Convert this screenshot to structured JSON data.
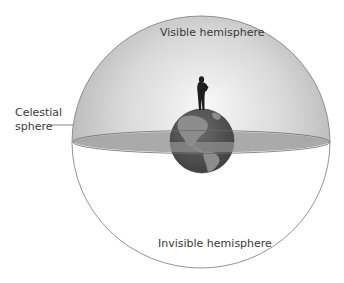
{
  "diagram": {
    "labels": {
      "visible_hemisphere": "Visible hemisphere",
      "invisible_hemisphere": "Invisible hemisphere",
      "celestial_sphere_line1": "Celestial",
      "celestial_sphere_line2": "sphere"
    },
    "elements": {
      "celestial_sphere": "circle",
      "horizon_plane": "ellipse",
      "earth": "globe",
      "observer": "person-silhouette"
    },
    "colors": {
      "sky_light": "#f4f4f4",
      "sky_dark": "#b5b5b5",
      "horizon_plane": "#9e9e9e",
      "earth_ocean": "#5a5a5a",
      "earth_land": "#8a8a8a",
      "outline": "#7a7a7a",
      "text": "#3a3a3a"
    }
  }
}
